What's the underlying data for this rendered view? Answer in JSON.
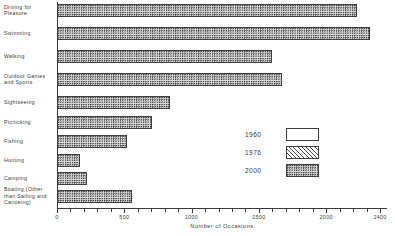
{
  "chart_data": {
    "type": "bar",
    "orientation": "horizontal",
    "stacked": true,
    "title": "",
    "xlabel": "Number of Occasions",
    "ylabel": "",
    "xlim": [
      0,
      2400
    ],
    "grid": false,
    "legend_position": "center-right",
    "categories": [
      "Driving for Pleasure",
      "Swimming",
      "Walking",
      "Outdoor Games and Sports",
      "Sightseeing",
      "Picnicking",
      "Fishing",
      "Hunting",
      "Camping",
      "Boating (Other than Sailing and Canoeing)"
    ],
    "series": [
      {
        "name": "1960",
        "pattern": "open",
        "values": [
          413,
          669,
          565,
          483,
          268,
          268,
          245,
          89,
          67,
          156
        ]
      },
      {
        "name": "1976",
        "pattern": "hatch",
        "values": [
          1337,
          1190,
          862,
          825,
          453,
          416,
          349,
          119,
          126,
          290
        ]
      },
      {
        "name": "2000",
        "pattern": "dots",
        "values": [
          2229,
          2326,
          1598,
          1672,
          840,
          706,
          520,
          171,
          223,
          557
        ]
      }
    ],
    "xticks_major": [
      0,
      500,
      1000,
      1500,
      2000,
      2400
    ],
    "xtick_labels": [
      "0",
      "500",
      "1000",
      "1500",
      "2000",
      "2400"
    ],
    "xtick_minor_step": 100
  },
  "categories": [
    {
      "label": "Driving for\nPleasure",
      "lines": [
        "Driving for",
        "Pleasure"
      ]
    },
    {
      "label": "Swimming",
      "lines": [
        "Swimming"
      ]
    },
    {
      "label": "Walking",
      "lines": [
        "Walking"
      ]
    },
    {
      "label": "Outdoor Games\nand Sports",
      "lines": [
        "Outdoor Games",
        "and Sports"
      ]
    },
    {
      "label": "Sightseeing",
      "lines": [
        "Sightseeing"
      ]
    },
    {
      "label": "Picnicking",
      "lines": [
        "Picnicking"
      ]
    },
    {
      "label": "Fishing",
      "lines": [
        "Fishing"
      ]
    },
    {
      "label": "Hunting",
      "lines": [
        "Hunting"
      ]
    },
    {
      "label": "Camping",
      "lines": [
        "Camping"
      ]
    },
    {
      "label": "Boating (Other\nthan Sailing and\nCanoeing)",
      "lines": [
        "Boating (Other",
        "than Sailing and",
        "Canoeing)"
      ]
    }
  ],
  "axis": {
    "x_title": "Number of Occasions",
    "tick_labels": [
      "0",
      "500",
      "1000",
      "1500",
      "2000",
      "2400"
    ]
  },
  "legend": {
    "items": [
      {
        "label": "1960",
        "pattern": "open"
      },
      {
        "label": "1976",
        "pattern": "hatch"
      },
      {
        "label": "2000",
        "pattern": "dots"
      }
    ]
  },
  "colors": {
    "ink": "#3a3a3a",
    "open_fill": "#ffffff",
    "hatch_fill": "#4a4a4a",
    "dots_fill": "#d8d8d8",
    "background": "#ffffff"
  }
}
